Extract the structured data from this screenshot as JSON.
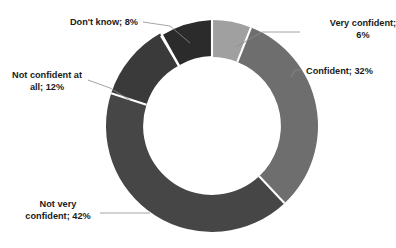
{
  "chart_data": {
    "type": "pie",
    "variant": "donut",
    "title": "",
    "xlabel": "",
    "ylabel": "",
    "units": "%",
    "start_angle_deg": 0,
    "direction": "clockwise",
    "grid": false,
    "legend": "none",
    "labels_position": "outside-with-leader-lines",
    "categories": [
      "Very confident",
      "Confident",
      "Not very confident",
      "Not confident at all",
      "Don't know"
    ],
    "values": [
      6,
      32,
      42,
      12,
      8
    ],
    "total": 100,
    "colors": [
      "#a0a0a0",
      "#6e6e6e",
      "#464646",
      "#3a3a3a",
      "#2b2b2b"
    ],
    "separator_color": "#ffffff",
    "background_color": "#ffffff",
    "hole_ratio": 0.65
  },
  "labels": {
    "very_confident": {
      "line1": "Very confident;",
      "line2": "6%",
      "full": "Very confident; 6%"
    },
    "confident": {
      "line1": "Confident; 32%",
      "full": "Confident; 32%"
    },
    "not_very_confident": {
      "line1": "Not very",
      "line2": "confident; 42%",
      "full": "Not very confident; 42%"
    },
    "not_confident_at_all": {
      "line1": "Not confident at",
      "line2": "all; 12%",
      "full": "Not confident at all; 12%"
    },
    "dont_know": {
      "line1": "Don't know; 8%",
      "full": "Don't know; 8%"
    }
  }
}
